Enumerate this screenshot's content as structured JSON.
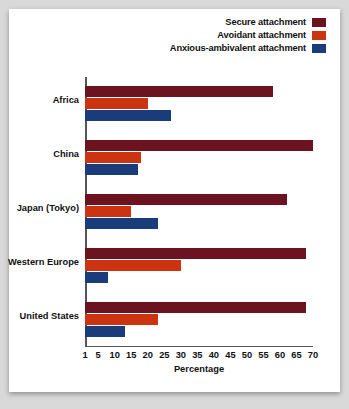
{
  "chart_data": {
    "type": "bar",
    "orientation": "horizontal",
    "title": "",
    "xlabel": "Percentage",
    "ylabel": "",
    "xlim": [
      1,
      70
    ],
    "xticks": [
      1,
      5,
      10,
      15,
      20,
      25,
      30,
      35,
      40,
      45,
      50,
      55,
      60,
      65,
      70
    ],
    "grid": false,
    "legend_position": "top-right",
    "categories": [
      "Africa",
      "China",
      "Japan (Tokyo)",
      "Western Europe",
      "United States"
    ],
    "series": [
      {
        "name": "Secure attachment",
        "color": "#6B1420",
        "values": [
          58,
          70,
          62,
          68,
          68
        ]
      },
      {
        "name": "Avoidant attachment",
        "color": "#CC3311",
        "values": [
          20,
          18,
          15,
          30,
          23
        ]
      },
      {
        "name": "Anxious-ambivalent attachment",
        "color": "#1A3C7A",
        "values": [
          27,
          17,
          23,
          8,
          13
        ]
      }
    ]
  },
  "legend": {
    "items": [
      {
        "label": "Secure attachment",
        "color": "#6B1420"
      },
      {
        "label": "Avoidant attachment",
        "color": "#CC3311"
      },
      {
        "label": "Anxious-ambivalent attachment",
        "color": "#1A3C7A"
      }
    ]
  },
  "axis": {
    "x_title": "Percentage",
    "x_ticks": [
      "1",
      "5",
      "10",
      "15",
      "20",
      "25",
      "30",
      "35",
      "40",
      "45",
      "50",
      "55",
      "60",
      "65",
      "70"
    ]
  }
}
